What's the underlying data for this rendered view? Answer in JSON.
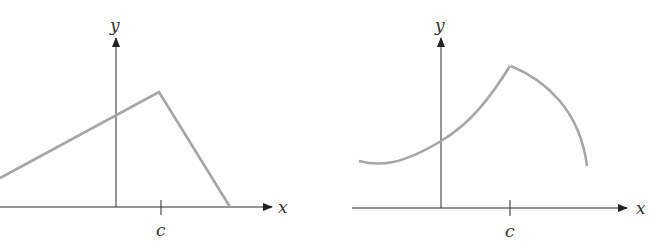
{
  "figures": [
    {
      "id": "left",
      "description": "Piecewise linear function with a corner (maximum) at x = c",
      "axis_labels": {
        "x": "x",
        "y": "y"
      },
      "tick_labels": [
        "c"
      ]
    },
    {
      "id": "right",
      "description": "Piecewise curved function with a corner (maximum) at x = c",
      "axis_labels": {
        "x": "x",
        "y": "y"
      },
      "tick_labels": [
        "c"
      ]
    }
  ],
  "colors": {
    "axis": "#2a2a2a",
    "curve": "#a6a6a6",
    "text": "#333333"
  }
}
